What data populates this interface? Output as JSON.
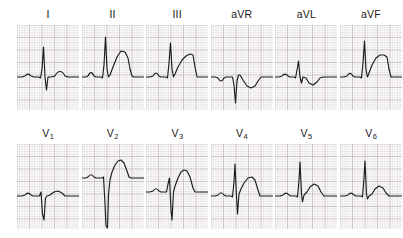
{
  "figure": {
    "kind": "12-lead-electrocardiogram",
    "grid": {
      "small_box_px": 2.5,
      "large_box_px": 12.5,
      "fine_color": "#d8d2d4",
      "bold_color": "#b9b0b4",
      "paper_color": "#fdfdfd"
    },
    "trace": {
      "color": "#1c1c1c",
      "width": 1.15,
      "baseline_y": 52
    },
    "panel": {
      "width": 62,
      "height": 85
    }
  },
  "rows": [
    {
      "name": "limb-leads",
      "leads": [
        {
          "id": "I",
          "label": "I",
          "subscript": "",
          "morphology": "small upright P, tall narrow R, small S, low upright T",
          "path": "M0,52 L5,52 L8,51 C10,48.5 12,48.5 14,51 L17,52 L22,52 L23.5,53 L25,44 L26.5,22 L28,52 L29.5,65 L31,52 L34,52 L38,51 C41,45 45,45 48,51 L51,52 L62,52"
        },
        {
          "id": "II",
          "label": "II",
          "subscript": "",
          "morphology": "upright P, very tall narrow R, large broad upright T",
          "path": "M0,52 L4,52 L6,51 C8,46.5 10,46.5 12,51 L14,52 L19,52 L20.5,53 L22,40 L23.5,12 L25,44 L26.5,52 L28,50 L31,42 L35,32 L39,26 L43,27 L46,33 L48,44 L50,51 L52,52 L62,52"
        },
        {
          "id": "III",
          "label": "III",
          "subscript": "",
          "morphology": "small P, tall R, broad upright T with slow downslope",
          "path": "M0,52 L4,52 L7,51 C9,47 11,47 13,51 L15,52 L20,52 L21.5,53 L23,38 L24.5,18 L26,44 L27.5,52 L29,49 L32,42 L36,35 L40,31 L44,29 L47,30 L49,42 L51,52 L62,52"
        },
        {
          "id": "aVR",
          "label": "aVR",
          "subscript": "",
          "morphology": "inverted P, deep narrow QS complex, inverted T",
          "path": "M0,52 L4,52 L7,53 C9,57 11,57 13,53 L15,52 L20,52 L21.5,52 L23,60 L24.5,78 L26,56 L27.5,50 L29,50 L32,55 L36,61 L40,63 L44,61 L47,56 L50,52 L53,52 L62,52"
        },
        {
          "id": "aVL",
          "label": "aVL",
          "subscript": "",
          "morphology": "small biphasic P, small R with S, shallow inverted T",
          "path": "M0,52 L4,52 L7,51 C9,48.5 11,48.5 13,51 L15,52 L19,52 L20.5,53 L22,45 L23.5,36 L25,52 L26.5,58 L28,52 L31,53 L34,58 L38,60 L42,57 L45,53 L48,52 L62,52"
        },
        {
          "id": "aVF",
          "label": "aVF",
          "subscript": "",
          "morphology": "small P, tall R, broad upright plateau T",
          "path": "M0,52 L4,52 L7,51 C9,47.5 11,47.5 13,51 L15,52 L20,52 L21.5,53 L23,38 L24.5,16 L26,45 L27.5,52 L29,48 L32,40 L36,33 L40,30 L44,30 L47,32 L49,44 L51,52 L62,52"
        }
      ]
    },
    {
      "name": "chest-leads",
      "leads": [
        {
          "id": "V1",
          "label": "V",
          "subscript": "1",
          "morphology": "small P, tiny r with deep S (rS), small upright T",
          "path": "M0,52 L5,52 L8,51 C10,48.5 12,48.5 14,51 L16,52 L21,52 L22.5,52 L24,48 L25.5,70 L27,76 L28.5,54 L30,52 L33,51 L37,48 L41,47 L45,49 L48,52 L62,52"
        },
        {
          "id": "V2",
          "label": "V",
          "subscript": "2",
          "morphology": "small P, very deep S, tall broad upright T",
          "path": "M0,34 L4,34 L6,33 C8,30 10,30 12,33 L14,34 L18,34 L20,34 L21.5,33 L23,60 L24,82 L25.5,84 L26.5,50 L28,36 L30,28 L33,21 L36,17 L39,16 L42,19 L45,27 L47,33 L49,34 L62,34"
        },
        {
          "id": "V3",
          "label": "V",
          "subscript": "3",
          "morphology": "small P, RS complex with deep S, tall broad T",
          "path": "M0,48 L4,48 L7,47 C9,44 11,44 13,47 L15,48 L19,48 L20.5,48 L22,40 L23.5,34 L25,66 L26,76 L27.5,48 L29,42 L32,34 L35,28 L38,26 L41,27 L44,33 L47,44 L49,48 L62,48"
        },
        {
          "id": "V4",
          "label": "V",
          "subscript": "4",
          "morphology": "small P, tall R with deep S, broad upright T",
          "path": "M0,52 L4,52 L7,51 C9,48 11,48 13,51 L15,52 L20,52 L21.5,53 L23,38 L24,20 L25.5,52 L26.5,70 L28,50 L30,45 L33,39 L37,34 L41,33 L44,36 L47,46 L49,52 L62,52"
        },
        {
          "id": "V5",
          "label": "V",
          "subscript": "5",
          "morphology": "small P, tall R, small S, moderate upright T",
          "path": "M0,52 L5,52 L8,51 C10,48.5 12,48.5 14,51 L16,52 L21,52 L22.5,53 L24,36 L25,18 L26.5,50 L27.5,58 L29,51 L32,48 L35,43 L39,40 L43,42 L46,48 L49,52 L62,52"
        },
        {
          "id": "V6",
          "label": "V",
          "subscript": "6",
          "morphology": "small P, tall R, minimal S, low broad upright T",
          "path": "M0,52 L5,52 L8,51 C10,48.5 12,48.5 14,51 L16,52 L21,52 L22.5,53 L24,34 L25,17 L26.5,50 L27.5,55 L29,52 L32,50 L35,45 L39,42 L43,44 L46,49 L49,52 L62,52"
        }
      ]
    }
  ],
  "chart_data": {
    "type": "line",
    "title": "",
    "xlabel": "",
    "ylabel": "",
    "legend": [],
    "grid": true,
    "panels": [
      {
        "lead": "I",
        "row": 1,
        "col": 1,
        "p_wave": "upright-small",
        "qrs": "qRs",
        "r_amplitude_mm": 12,
        "s_amplitude_mm": 5,
        "t_wave": "upright-low"
      },
      {
        "lead": "II",
        "row": 1,
        "col": 2,
        "p_wave": "upright",
        "qrs": "qR",
        "r_amplitude_mm": 16,
        "s_amplitude_mm": 0,
        "t_wave": "upright-tall-broad"
      },
      {
        "lead": "III",
        "row": 1,
        "col": 3,
        "p_wave": "upright-small",
        "qrs": "qR",
        "r_amplitude_mm": 13,
        "s_amplitude_mm": 0,
        "t_wave": "upright-broad"
      },
      {
        "lead": "aVR",
        "row": 1,
        "col": 4,
        "p_wave": "inverted",
        "qrs": "QS",
        "r_amplitude_mm": 0,
        "s_amplitude_mm": 10,
        "t_wave": "inverted"
      },
      {
        "lead": "aVL",
        "row": 1,
        "col": 5,
        "p_wave": "biphasic-small",
        "qrs": "rS",
        "r_amplitude_mm": 6,
        "s_amplitude_mm": 3,
        "t_wave": "inverted-shallow"
      },
      {
        "lead": "aVF",
        "row": 1,
        "col": 6,
        "p_wave": "upright-small",
        "qrs": "qR",
        "r_amplitude_mm": 14,
        "s_amplitude_mm": 0,
        "t_wave": "upright-broad"
      },
      {
        "lead": "V1",
        "row": 2,
        "col": 1,
        "p_wave": "upright-small",
        "qrs": "rS",
        "r_amplitude_mm": 2,
        "s_amplitude_mm": 10,
        "t_wave": "upright-low"
      },
      {
        "lead": "V2",
        "row": 2,
        "col": 2,
        "p_wave": "upright-small",
        "qrs": "rS",
        "r_amplitude_mm": 1,
        "s_amplitude_mm": 20,
        "t_wave": "upright-tall"
      },
      {
        "lead": "V3",
        "row": 2,
        "col": 3,
        "p_wave": "upright-small",
        "qrs": "RS",
        "r_amplitude_mm": 6,
        "s_amplitude_mm": 13,
        "t_wave": "upright-tall"
      },
      {
        "lead": "V4",
        "row": 2,
        "col": 4,
        "p_wave": "upright-small",
        "qrs": "RS",
        "r_amplitude_mm": 13,
        "s_amplitude_mm": 7,
        "t_wave": "upright-broad"
      },
      {
        "lead": "V5",
        "row": 2,
        "col": 5,
        "p_wave": "upright-small",
        "qrs": "qRs",
        "r_amplitude_mm": 14,
        "s_amplitude_mm": 3,
        "t_wave": "upright"
      },
      {
        "lead": "V6",
        "row": 2,
        "col": 6,
        "p_wave": "upright-small",
        "qrs": "qRs",
        "r_amplitude_mm": 14,
        "s_amplitude_mm": 2,
        "t_wave": "upright-low"
      }
    ]
  }
}
